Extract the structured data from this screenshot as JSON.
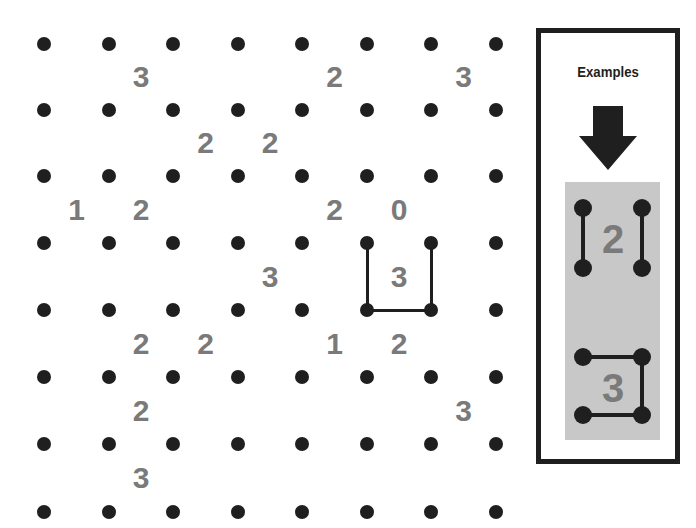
{
  "puzzle": {
    "type": "slitherlink",
    "grid_cols": 7,
    "grid_rows": 7,
    "dot_x": [
      44,
      109,
      173,
      238,
      302,
      367,
      431,
      496
    ],
    "dot_y": [
      44,
      110,
      176,
      243,
      310,
      377,
      444,
      512
    ],
    "clues": [
      {
        "row": 0,
        "col": 1,
        "value": "3"
      },
      {
        "row": 0,
        "col": 4,
        "value": "2"
      },
      {
        "row": 0,
        "col": 6,
        "value": "3"
      },
      {
        "row": 1,
        "col": 2,
        "value": "2"
      },
      {
        "row": 1,
        "col": 3,
        "value": "2"
      },
      {
        "row": 2,
        "col": 0,
        "value": "1"
      },
      {
        "row": 2,
        "col": 1,
        "value": "2"
      },
      {
        "row": 2,
        "col": 4,
        "value": "2"
      },
      {
        "row": 2,
        "col": 5,
        "value": "0"
      },
      {
        "row": 3,
        "col": 3,
        "value": "3"
      },
      {
        "row": 3,
        "col": 5,
        "value": "3"
      },
      {
        "row": 4,
        "col": 1,
        "value": "2"
      },
      {
        "row": 4,
        "col": 2,
        "value": "2"
      },
      {
        "row": 4,
        "col": 4,
        "value": "1"
      },
      {
        "row": 4,
        "col": 5,
        "value": "2"
      },
      {
        "row": 5,
        "col": 1,
        "value": "2"
      },
      {
        "row": 5,
        "col": 6,
        "value": "3"
      },
      {
        "row": 6,
        "col": 1,
        "value": "3"
      }
    ],
    "drawn_edges": [
      {
        "from": [
          3,
          5
        ],
        "to": [
          4,
          5
        ]
      },
      {
        "from": [
          3,
          6
        ],
        "to": [
          4,
          6
        ]
      },
      {
        "from": [
          4,
          5
        ],
        "to": [
          4,
          6
        ]
      }
    ],
    "colors": {
      "dot": "#1f1f1f",
      "clue": "#7a7a7a",
      "line": "#1f1f1f"
    }
  },
  "examples": {
    "title": "Examples",
    "arrow_icon": "down-arrow",
    "panel_color": "#c8c8c8",
    "example_1": {
      "clue": "2",
      "description": "left and right sides drawn"
    },
    "example_2": {
      "clue": "3",
      "description": "top, right and bottom sides drawn"
    }
  }
}
